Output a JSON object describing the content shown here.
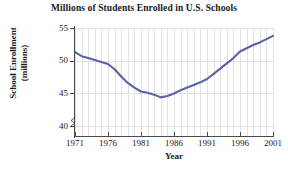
{
  "chart_data": {
    "type": "line",
    "title": "Millions of Students Enrolled in U.S. Schools",
    "xlabel": "Year",
    "ylabel": "School Enrollment (millions)",
    "ylabel_line1": "School Enrollment",
    "ylabel_line2": "(millions)",
    "xlim": [
      1971,
      2001
    ],
    "ylim": [
      38.5,
      55
    ],
    "yticks": [
      40,
      45,
      50,
      55
    ],
    "ytick_labels": [
      "40",
      "45",
      "50",
      "55"
    ],
    "xticks": [
      1971,
      1976,
      1981,
      1986,
      1991,
      1996,
      2001
    ],
    "xtick_labels": [
      "1971",
      "1976",
      "1981",
      "1986",
      "1991",
      "1996",
      "2001"
    ],
    "grid": true,
    "grid_vertical_step": 1,
    "grid_horizontal": [
      40,
      45,
      50,
      55
    ],
    "legend": null,
    "y_axis_break": true,
    "series": [
      {
        "name": "School Enrollment",
        "color": "#5a63a5",
        "x": [
          1971,
          1972,
          1973,
          1974,
          1975,
          1976,
          1977,
          1978,
          1979,
          1980,
          1981,
          1982,
          1983,
          1984,
          1985,
          1986,
          1987,
          1988,
          1989,
          1990,
          1991,
          1992,
          1993,
          1994,
          1995,
          1996,
          1997,
          1998,
          1999,
          2000,
          2001
        ],
        "values": [
          51.3,
          50.7,
          50.4,
          50.1,
          49.8,
          49.5,
          48.7,
          47.6,
          46.6,
          45.9,
          45.3,
          45.1,
          44.8,
          44.4,
          44.6,
          45.0,
          45.5,
          45.9,
          46.3,
          46.7,
          47.2,
          48.0,
          48.8,
          49.6,
          50.4,
          51.4,
          51.9,
          52.4,
          52.8,
          53.3,
          53.8
        ]
      }
    ]
  },
  "colors": {
    "line": "#5a63a5",
    "grid": "#e2e2e2",
    "axis": "#4a4a4a",
    "text": "#1a1a1a",
    "background": "#ffffff"
  }
}
